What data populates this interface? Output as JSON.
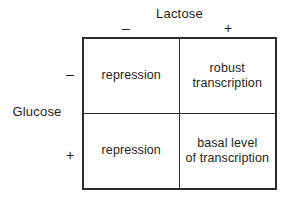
{
  "figure": {
    "column_axis": {
      "label": "Lactose",
      "levels": [
        "–",
        "+"
      ]
    },
    "row_axis": {
      "label": "Glucose",
      "levels": [
        "–",
        "+"
      ]
    },
    "cells": [
      {
        "row": "–",
        "col": "–",
        "text": "repression"
      },
      {
        "row": "–",
        "col": "+",
        "text": "robust\ntranscription"
      },
      {
        "row": "+",
        "col": "–",
        "text": "repression"
      },
      {
        "row": "+",
        "col": "+",
        "text": "basal level\nof transcription"
      }
    ],
    "colors": {
      "border": "#2b2b2b",
      "text": "#231f20",
      "background": "#ffffff"
    }
  }
}
